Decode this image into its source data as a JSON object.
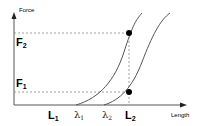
{
  "diagram": {
    "y_axis_label": "Force",
    "x_axis_label": "Length",
    "force_levels": [
      {
        "label": "F",
        "sub": "2"
      },
      {
        "label": "F",
        "sub": "1"
      }
    ],
    "length_marks": [
      {
        "label": "L",
        "sub": "1"
      },
      {
        "label": "λ",
        "sub": "1"
      },
      {
        "label": "λ",
        "sub": "2"
      },
      {
        "label": "L",
        "sub": "2"
      }
    ],
    "curves": [
      {
        "name": "curve-1",
        "start_label": "λ1"
      },
      {
        "name": "curve-2",
        "start_label": "λ2"
      }
    ],
    "points": [
      {
        "name": "point-F2-L2",
        "force": "F2",
        "length": "L2"
      },
      {
        "name": "point-F1-L2",
        "force": "F1",
        "length": "L2"
      }
    ],
    "colors": {
      "axis": "#555555",
      "curve": "#555555",
      "dashed": "#888888",
      "point": "#000000"
    }
  }
}
